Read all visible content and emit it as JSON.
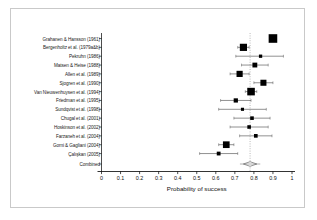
{
  "chart_data": {
    "type": "forest",
    "title": "",
    "xlabel": "Probability of success",
    "ylabel": "",
    "xlim": [
      0,
      1
    ],
    "xticks": [
      0,
      0.1,
      0.2,
      0.3,
      0.4,
      0.5,
      0.6,
      0.7,
      0.8,
      0.9,
      1
    ],
    "xtick_labels": [
      "0",
      "0.1",
      "0.2",
      "0.3",
      "0.4",
      "0.5",
      "0.6",
      "0.7",
      "0.8",
      "0.9",
      "1"
    ],
    "grid": false,
    "legend": "none",
    "reference_line": 0.78,
    "reference_line_style": "dotted",
    "marker_shape": "square",
    "marker_color": "#000000",
    "summary_shape": "diamond",
    "summary_label": "Combined",
    "summary_estimate": 0.78,
    "summary_ci": [
      0.745,
      0.815
    ],
    "categories": [
      "Grahanen & Hansson (1961)",
      "Bergenholtz et al. (1979a&b)",
      "Pekruhn (1986)",
      "Matsen & Heise (1988)",
      "Allen et al. (1989)",
      "Sjogren et al. (1990)",
      "Van Nieuwenhuysen et al. (1994)",
      "Friedman et al. (1995)",
      "Sundqvist et al. (1998)",
      "Chugal et al. (2001)",
      "Hoskinson et al. (2002)",
      "Farzaneh et al. (2004)",
      "Gorni & Gagliani (2004)",
      "Çalışkan (2005)"
    ],
    "studies": [
      {
        "label": "Grahanen & Hansson (1961)",
        "estimate": 0.9,
        "ci_low": 0.885,
        "ci_high": 0.915,
        "weight": 1.0
      },
      {
        "label": "Bergenholtz et al. (1979a&b)",
        "estimate": 0.745,
        "ci_low": 0.715,
        "ci_high": 0.775,
        "weight": 0.78
      },
      {
        "label": "Pekruhn (1986)",
        "estimate": 0.835,
        "ci_low": 0.705,
        "ci_high": 0.955,
        "weight": 0.17
      },
      {
        "label": "Matsen & Heise (1988)",
        "estimate": 0.805,
        "ci_low": 0.735,
        "ci_high": 0.875,
        "weight": 0.41
      },
      {
        "label": "Allen et al. (1989)",
        "estimate": 0.725,
        "ci_low": 0.675,
        "ci_high": 0.775,
        "weight": 0.62
      },
      {
        "label": "Sjogren et al. (1990)",
        "estimate": 0.85,
        "ci_low": 0.8,
        "ci_high": 0.9,
        "weight": 0.6
      },
      {
        "label": "Van Nieuwenhuysen et al. (1994)",
        "estimate": 0.785,
        "ci_low": 0.755,
        "ci_high": 0.815,
        "weight": 0.84
      },
      {
        "label": "Friedman et al. (1995)",
        "estimate": 0.705,
        "ci_low": 0.625,
        "ci_high": 0.785,
        "weight": 0.32
      },
      {
        "label": "Sundqvist et al. (1998)",
        "estimate": 0.74,
        "ci_low": 0.615,
        "ci_high": 0.865,
        "weight": 0.14
      },
      {
        "label": "Chugal et al. (2001)",
        "estimate": 0.79,
        "ci_low": 0.695,
        "ci_high": 0.885,
        "weight": 0.22
      },
      {
        "label": "Hoskinson et al. (2002)",
        "estimate": 0.775,
        "ci_low": 0.675,
        "ci_high": 0.875,
        "weight": 0.22
      },
      {
        "label": "Farzaneh et al. (2004)",
        "estimate": 0.81,
        "ci_low": 0.725,
        "ci_high": 0.895,
        "weight": 0.23
      },
      {
        "label": "Gorni & Gagliani (2004)",
        "estimate": 0.655,
        "ci_low": 0.615,
        "ci_high": 0.695,
        "weight": 0.7
      },
      {
        "label": "Çalışkan (2005)",
        "estimate": 0.615,
        "ci_low": 0.515,
        "ci_high": 0.715,
        "weight": 0.25
      }
    ]
  }
}
